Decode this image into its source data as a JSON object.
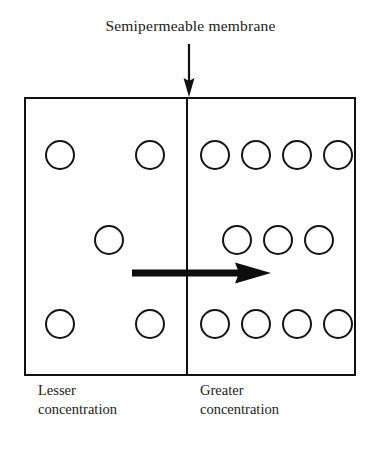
{
  "figure": {
    "title": "Semipermeable membrane",
    "width": 381,
    "height": 451,
    "background_color": "#ffffff",
    "stroke_color": "#111111"
  },
  "pointer_arrow": {
    "name": "membrane-pointer-arrow",
    "direction": "down",
    "from_x": 189,
    "from_y": 44,
    "to_x": 189,
    "to_y": 97
  },
  "vessel": {
    "name": "container-box",
    "x": 24,
    "y": 97,
    "width": 332,
    "height": 279,
    "border_color": "#111111"
  },
  "membrane": {
    "name": "semipermeable-membrane-line",
    "x": 186,
    "y": 97,
    "height": 279,
    "color": "#111111"
  },
  "flow_arrow": {
    "name": "water-flow-arrow",
    "direction": "right",
    "from_x": 135,
    "to_x": 268,
    "y": 273,
    "color": "#0d0d0d"
  },
  "compartments": {
    "left": {
      "label_line1": "Lesser",
      "label_line2": "concentration",
      "particle_count": 5
    },
    "right": {
      "label_line1": "Greater",
      "label_line2": "concentration",
      "particle_count": 11
    }
  },
  "particles": {
    "diameter": 30,
    "stroke_color": "#141414",
    "fill_color": "#ffffff",
    "left": [
      {
        "x": 45,
        "y": 140
      },
      {
        "x": 135,
        "y": 140
      },
      {
        "x": 94,
        "y": 225
      },
      {
        "x": 45,
        "y": 309
      },
      {
        "x": 135,
        "y": 309
      }
    ],
    "right": [
      {
        "x": 200,
        "y": 140
      },
      {
        "x": 241,
        "y": 140
      },
      {
        "x": 282,
        "y": 140
      },
      {
        "x": 323,
        "y": 140
      },
      {
        "x": 222,
        "y": 225
      },
      {
        "x": 263,
        "y": 225
      },
      {
        "x": 304,
        "y": 225
      },
      {
        "x": 200,
        "y": 309
      },
      {
        "x": 241,
        "y": 309
      },
      {
        "x": 282,
        "y": 309
      },
      {
        "x": 323,
        "y": 309
      }
    ]
  }
}
